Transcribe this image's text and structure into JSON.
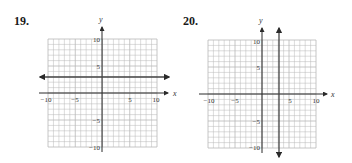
{
  "problems": [
    {
      "number": "19.",
      "x_axis_label": "x",
      "y_axis_label": "y"
    },
    {
      "number": "20.",
      "x_axis_label": "x",
      "y_axis_label": "y"
    }
  ],
  "tick_labels": {
    "x": [
      "−10",
      "−5",
      "5",
      "10"
    ],
    "y_pos": [
      "10",
      "5"
    ],
    "y_neg": [
      "−5",
      "−10"
    ]
  },
  "colors": {
    "grid": "#b8b8b8",
    "axis": "#2a2a2a",
    "graph_line": "#444444"
  },
  "chart_data": [
    {
      "type": "line",
      "title": "19.",
      "xlabel": "x",
      "ylabel": "y",
      "xlim": [
        -10,
        10
      ],
      "ylim": [
        -10,
        10
      ],
      "grid": true,
      "x_ticks": [
        -10,
        -5,
        5,
        10
      ],
      "y_ticks": [
        -10,
        -5,
        5,
        10
      ],
      "series": [
        {
          "name": "horizontal line y = 3",
          "equation": "y = 3",
          "x": [
            -11,
            12
          ],
          "y": [
            3,
            3
          ]
        }
      ]
    },
    {
      "type": "line",
      "title": "20.",
      "xlabel": "x",
      "ylabel": "y",
      "xlim": [
        -10,
        10
      ],
      "ylim": [
        -10,
        10
      ],
      "grid": true,
      "x_ticks": [
        -10,
        -5,
        5,
        10
      ],
      "y_ticks": [
        -10,
        -5,
        5,
        10
      ],
      "series": [
        {
          "name": "vertical line x = 3",
          "equation": "x = 3",
          "x": [
            3,
            3
          ],
          "y": [
            12,
            -12
          ]
        }
      ]
    }
  ]
}
